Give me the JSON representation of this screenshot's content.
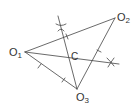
{
  "diagram": {
    "stroke_color": "#444444",
    "points": {
      "O1": {
        "label": "O",
        "sub": "1",
        "x": 25,
        "y": 52
      },
      "O2": {
        "label": "O",
        "sub": "2",
        "x": 115,
        "y": 18
      },
      "O3": {
        "label": "O",
        "sub": "3",
        "x": 77,
        "y": 89
      },
      "C": {
        "label": "C",
        "x": 70,
        "y": 57
      }
    },
    "edges": [
      [
        "O1",
        "O2"
      ],
      [
        "O2",
        "O3"
      ],
      [
        "O3",
        "O1"
      ]
    ],
    "bisectors": [
      {
        "name": "bisector-O1-O2",
        "from": [
          58,
          17
        ],
        "to": [
          77,
          89
        ]
      },
      {
        "name": "bisector-O2-O3",
        "from": [
          25,
          52
        ],
        "to": [
          118,
          64
        ]
      }
    ],
    "arc_crosses": [
      {
        "x": 61,
        "y": 28
      },
      {
        "x": 111,
        "y": 63
      }
    ]
  }
}
